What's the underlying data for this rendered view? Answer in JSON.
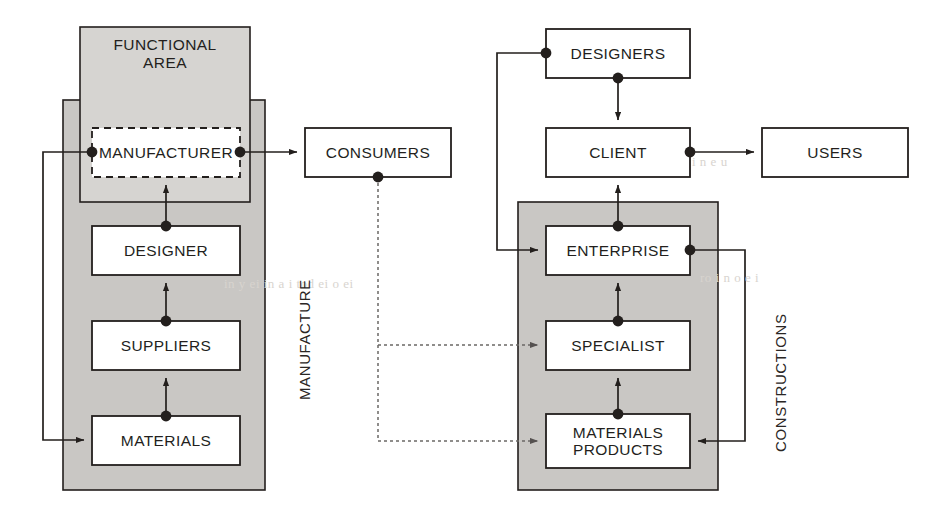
{
  "diagram": {
    "title_group_left": "FUNCTIONAL\nAREA",
    "vertical_labels": {
      "manufacture": "MANUFACTURE",
      "constructions": "CONSTRUCTIONS"
    },
    "colors": {
      "band_fill": "#c9c7c4",
      "box_fill": "#ffffff",
      "stroke": "#231f1d",
      "page": "#ffffff",
      "bleed_text": "#d8d4cf"
    },
    "left_flow": {
      "boxes": [
        {
          "id": "manufacturer",
          "label": "MANUFACTURER",
          "style": "dashed",
          "x": 92,
          "y": 128,
          "w": 148,
          "h": 49
        },
        {
          "id": "designer",
          "label": "DESIGNER",
          "style": "solid",
          "x": 92,
          "y": 226,
          "w": 148,
          "h": 49
        },
        {
          "id": "suppliers",
          "label": "SUPPLIERS",
          "style": "solid",
          "x": 92,
          "y": 321,
          "w": 148,
          "h": 49
        },
        {
          "id": "materials",
          "label": "MATERIALS",
          "style": "solid",
          "x": 92,
          "y": 416,
          "w": 148,
          "h": 49
        }
      ]
    },
    "middle": {
      "boxes": [
        {
          "id": "consumers",
          "label": "CONSUMERS",
          "style": "solid",
          "x": 305,
          "y": 128,
          "w": 146,
          "h": 49
        }
      ]
    },
    "right_flow": {
      "boxes": [
        {
          "id": "designers",
          "label": "DESIGNERS",
          "style": "solid",
          "x": 546,
          "y": 29,
          "w": 144,
          "h": 49
        },
        {
          "id": "client",
          "label": "CLIENT",
          "style": "solid",
          "x": 546,
          "y": 128,
          "w": 144,
          "h": 49
        },
        {
          "id": "users",
          "label": "USERS",
          "style": "solid",
          "x": 762,
          "y": 128,
          "w": 146,
          "h": 49
        },
        {
          "id": "enterprise",
          "label": "ENTERPRISE",
          "style": "solid",
          "x": 546,
          "y": 226,
          "w": 144,
          "h": 49
        },
        {
          "id": "specialist",
          "label": "SPECIALIST",
          "style": "solid",
          "x": 546,
          "y": 321,
          "w": 144,
          "h": 49
        },
        {
          "id": "materials_products",
          "label": "MATERIALS\nPRODUCTS",
          "style": "solid",
          "x": 546,
          "y": 414,
          "w": 144,
          "h": 54
        }
      ]
    },
    "bands": [
      {
        "id": "left-band",
        "x": 63,
        "y": 100,
        "w": 202,
        "h": 390
      },
      {
        "id": "functional-area-box",
        "x": 80,
        "y": 27,
        "w": 170,
        "h": 175
      },
      {
        "id": "right-band",
        "x": 518,
        "y": 202,
        "w": 200,
        "h": 288
      }
    ],
    "bleed_text": [
      {
        "text": "in y  ei  in  a  i  tod  ei  o  ei",
        "x": 224,
        "y": 282,
        "size": 12
      },
      {
        "text": "ro   i   n o  e  i",
        "x": 700,
        "y": 276,
        "size": 13
      },
      {
        "text": "i n  e  u",
        "x": 690,
        "y": 160,
        "size": 12
      }
    ]
  }
}
